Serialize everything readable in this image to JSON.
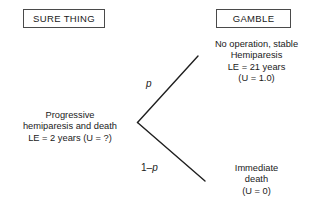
{
  "diagram": {
    "type": "decision-tree",
    "headers": {
      "left_label": "SURE THING",
      "right_label": "GAMBLE"
    },
    "nodes": {
      "root": {
        "name": "progressive-hemiparesis-and-death",
        "lines": [
          "Progressive",
          "hemiparesis and death",
          "LE = 2 years (U = ?)"
        ]
      },
      "top_outcome": {
        "name": "no-operation-stable-hemiparesis",
        "lines": [
          "No operation, stable",
          "Hemiparesis",
          "LE = 21 years",
          "(U = 1.0)"
        ]
      },
      "bottom_outcome": {
        "name": "immediate-death",
        "lines": [
          "Immediate",
          "death",
          "(U = 0)"
        ]
      }
    },
    "branches": {
      "upper": {
        "probability_prefix": "",
        "probability_symbol": "p",
        "probability_suffix": ""
      },
      "lower": {
        "probability_prefix": "1–",
        "probability_symbol": "p",
        "probability_suffix": ""
      }
    },
    "colors": {
      "background": "#ffffff",
      "text": "#1a1a1a",
      "line": "#1f1f1f",
      "box_border": "#4a4a4a"
    }
  }
}
